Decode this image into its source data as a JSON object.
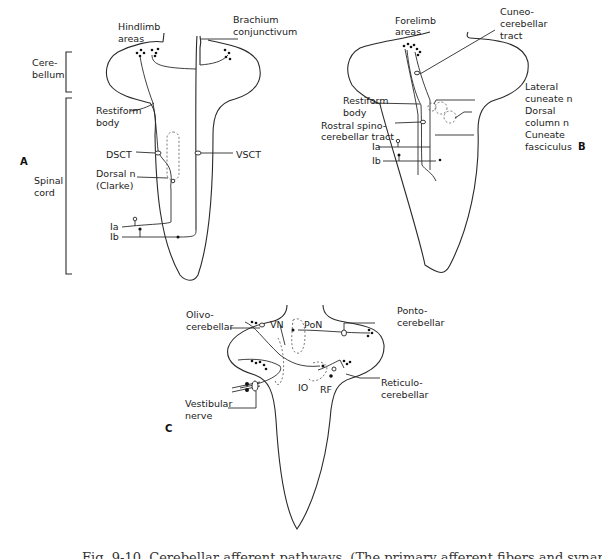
{
  "panel_a": {
    "letter": "A",
    "labels": {
      "hindlimb_1": "Hindlimb",
      "hindlimb_2": "areas",
      "brachium_1": "Brachium",
      "brachium_2": "conjunctivum",
      "cerebellum_1": "Cere-",
      "cerebellum_2": "bellum",
      "restiform_1": "Restiform",
      "restiform_2": "body",
      "dsct": "DSCT",
      "vsct": "VSCT",
      "dorsal_n_1": "Dorsal  n",
      "dorsal_n_2": "(Clarke)",
      "spinal_1": "Spinal",
      "spinal_2": "cord",
      "ia": "Ia",
      "ib": "Ib"
    }
  },
  "panel_b": {
    "letter": "B",
    "labels": {
      "forelimb_1": "Forelimb",
      "forelimb_2": "areas",
      "cuneo_1": "Cuneo-",
      "cuneo_2": "cerebellar",
      "cuneo_3": "tract",
      "lateral_1": "Lateral",
      "lateral_2": "cuneate  n",
      "dorsal_col_1": "Dorsal",
      "dorsal_col_2": "column  n",
      "cuneate_f_1": "Cuneate",
      "cuneate_f_2": "fasciculus",
      "restiform_1": "Restiform",
      "restiform_2": "body",
      "rostral_1": "Rostral  spino-",
      "rostral_2": "cerebellar  tract",
      "ia": "Ia",
      "ib": "Ib"
    }
  },
  "panel_c": {
    "letter": "C",
    "labels": {
      "olivo_1": "Olivo-",
      "olivo_2": "cerebellar",
      "vn": "VN",
      "pon": "PoN",
      "ponto_1": "Ponto-",
      "ponto_2": "cerebellar",
      "io": "IO",
      "rf": "RF",
      "reticulo_1": "Reticulo-",
      "reticulo_2": "cerebellar",
      "vestibular_1": "Vestibular",
      "vestibular_2": "nerve"
    }
  },
  "caption": "Fig. 9-10. Cerebellar afferent pathways. (The primary afferent fibers and synaptic connections"
}
